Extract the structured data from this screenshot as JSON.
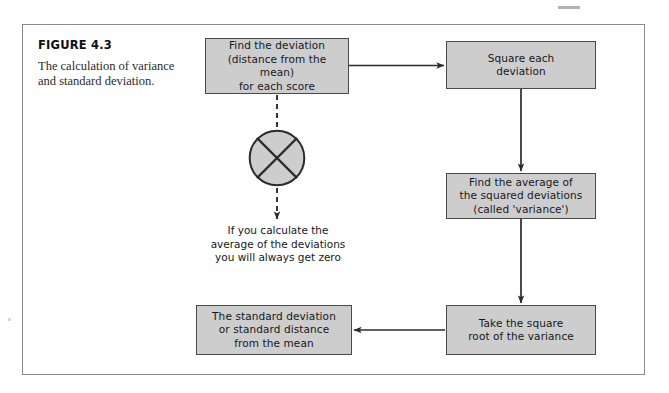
{
  "figure": {
    "label": "FIGURE 4.3",
    "caption": "The calculation of variance and standard deviation."
  },
  "flowchart": {
    "type": "process-flow-diagram",
    "boxes": [
      {
        "id": "deviation",
        "text": "Find the deviation (distance from the mean) for each score",
        "lines": [
          "Find the deviation",
          "(distance from the mean)",
          "for each score"
        ]
      },
      {
        "id": "square",
        "text": "Square each deviation",
        "lines": [
          "Square each",
          "deviation"
        ]
      },
      {
        "id": "variance",
        "text": "Find the average of the squared deviations (called 'variance')",
        "lines": [
          "Find the average of",
          "the squared deviations",
          "(called 'variance')"
        ]
      },
      {
        "id": "sqrt",
        "text": "Take the square root of the variance",
        "lines": [
          "Take the square",
          "root of the variance"
        ]
      },
      {
        "id": "stddev",
        "text": "The standard deviation or standard distance from the mean",
        "lines": [
          "The standard deviation",
          "or standard distance",
          "from the mean"
        ]
      }
    ],
    "note": {
      "id": "zero-note",
      "text": "If you calculate the average of the deviations you will always get zero",
      "lines": [
        "If you calculate the",
        "average of the deviations",
        "you will always get zero"
      ]
    },
    "symbol": {
      "id": "crossed-circle",
      "name": "crossed-circle-icon",
      "fill": "#cdcdcd",
      "stroke": "#2b2b2b"
    },
    "connectors": [
      {
        "from": "deviation",
        "to": "square",
        "style": "solid",
        "direction": "right"
      },
      {
        "from": "square",
        "to": "variance",
        "style": "solid",
        "direction": "down"
      },
      {
        "from": "variance",
        "to": "sqrt",
        "style": "solid",
        "direction": "down"
      },
      {
        "from": "sqrt",
        "to": "stddev",
        "style": "solid",
        "direction": "left"
      },
      {
        "from": "deviation",
        "to": "crossed-circle",
        "style": "dashed",
        "direction": "down"
      },
      {
        "from": "crossed-circle",
        "to": "zero-note",
        "style": "dashed",
        "direction": "down"
      }
    ]
  },
  "style": {
    "box_fill": "#cdcdcd",
    "box_border": "#4a4a4a",
    "frame_border": "#8a8a8a",
    "line_color": "#2b2b2b",
    "page_background": "#ffffff"
  }
}
